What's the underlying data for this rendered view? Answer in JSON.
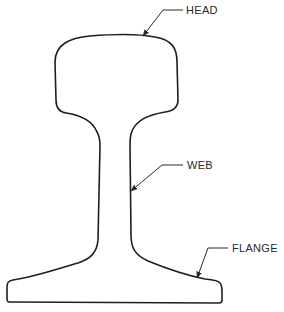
{
  "diagram": {
    "labels": {
      "head": "HEAD",
      "web": "WEB",
      "flange": "FLANGE"
    },
    "colors": {
      "line": "#1e1e1e",
      "text": "#2a2a2a",
      "background": "#ffffff"
    }
  }
}
